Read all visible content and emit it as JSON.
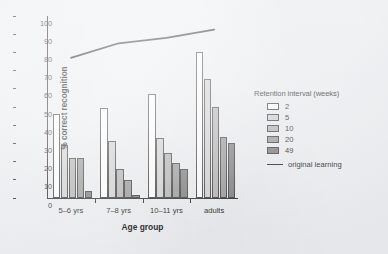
{
  "chart_data": {
    "type": "bar",
    "title": "",
    "subtitle": "",
    "xlabel": "Age group",
    "ylabel": "% correct recognition",
    "categories": [
      "5–6 yrs",
      "7–8 yrs",
      "10–11 yrs",
      "adults"
    ],
    "ylim": [
      0,
      100
    ],
    "yticks": [
      0,
      10,
      20,
      30,
      40,
      50,
      60,
      70,
      80,
      90,
      100
    ],
    "grid": false,
    "legend_position": "right",
    "legend_title": "Retention interval (weeks)",
    "series": [
      {
        "name": "2",
        "values": [
          46.0,
          49.5,
          57.0,
          80.0
        ],
        "color": "#ffffff"
      },
      {
        "name": "5",
        "values": [
          29.0,
          31.5,
          33.0,
          65.5
        ],
        "color": "#d2d2d2"
      },
      {
        "name": "10",
        "values": [
          22.0,
          15.8,
          24.5,
          50.0
        ],
        "color": "#b4b4b4"
      },
      {
        "name": "20",
        "values": [
          22.0,
          10.0,
          19.0,
          33.5
        ],
        "color": "#9a9a9a"
      },
      {
        "name": "49",
        "values": [
          3.8,
          1.4,
          16.2,
          30.0
        ],
        "color": "#7e7e7e"
      }
    ],
    "overlay_series": {
      "name": "original learning",
      "type": "line",
      "values": [
        77.0,
        85.0,
        88.0,
        92.5
      ],
      "color": "#232325"
    },
    "annotations": []
  },
  "legend": {
    "title": "Retention interval (weeks)",
    "items": [
      {
        "label": "2"
      },
      {
        "label": "5"
      },
      {
        "label": "10"
      },
      {
        "label": "20"
      },
      {
        "label": "49"
      }
    ],
    "line_label": "original learning"
  },
  "axes": {
    "x_title": "Age group",
    "y_title": "% correct recognition"
  }
}
